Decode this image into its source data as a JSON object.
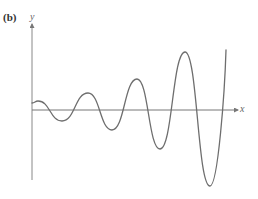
{
  "figure": {
    "panel_label": "(b)",
    "y_axis_label": "y",
    "x_axis_label": "x",
    "colors": {
      "axis": "#777777",
      "curve": "#6e6e6e",
      "label": "#333333"
    }
  },
  "chart_data": {
    "type": "line",
    "title": "",
    "xlabel": "x",
    "ylabel": "y",
    "grid": false,
    "ticks": false,
    "extrema_pixel_points": [
      {
        "kind": "start",
        "x": 32,
        "y": 103
      },
      {
        "kind": "max",
        "x": 38,
        "y": 101
      },
      {
        "kind": "min",
        "x": 62,
        "y": 121
      },
      {
        "kind": "max",
        "x": 88,
        "y": 93
      },
      {
        "kind": "min",
        "x": 112,
        "y": 130
      },
      {
        "kind": "max",
        "x": 137,
        "y": 79
      },
      {
        "kind": "min",
        "x": 160,
        "y": 149
      },
      {
        "kind": "max",
        "x": 185,
        "y": 52
      },
      {
        "kind": "min",
        "x": 210,
        "y": 186
      },
      {
        "kind": "end",
        "x": 226,
        "y": 50
      }
    ],
    "axis_origin_pixel": {
      "x": 32,
      "y": 110
    }
  }
}
